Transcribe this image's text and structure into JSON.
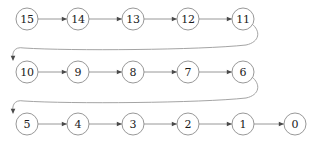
{
  "diagram": {
    "type": "node-chain-diagram",
    "colors": {
      "background": "#ffffff",
      "node_stroke": "#8c8c8c",
      "node_fill": "#ffffff",
      "label_text": "#1a1a1a",
      "edge_stroke": "#8c8c8c",
      "curve_stroke": "#9a9a9a",
      "arrow_fill": "#4a4a4a"
    },
    "node_radius": 11,
    "rows": [
      {
        "row_index": 0,
        "y": 19,
        "nodes": [
          {
            "label": "15",
            "x": 27
          },
          {
            "label": "14",
            "x": 78
          },
          {
            "label": "13",
            "x": 133
          },
          {
            "label": "12",
            "x": 188
          },
          {
            "label": "11",
            "x": 243
          }
        ]
      },
      {
        "row_index": 1,
        "y": 72,
        "nodes": [
          {
            "label": "10",
            "x": 27
          },
          {
            "label": "9",
            "x": 78
          },
          {
            "label": "8",
            "x": 133
          },
          {
            "label": "7",
            "x": 188
          },
          {
            "label": "6",
            "x": 243
          }
        ]
      },
      {
        "row_index": 2,
        "y": 124,
        "nodes": [
          {
            "label": "5",
            "x": 27
          },
          {
            "label": "4",
            "x": 78
          },
          {
            "label": "3",
            "x": 133
          },
          {
            "label": "2",
            "x": 188
          },
          {
            "label": "1",
            "x": 243
          },
          {
            "label": "0",
            "x": 295
          }
        ]
      }
    ],
    "straight_edges": [
      {
        "from": "15",
        "to": "14",
        "x1": 38,
        "y1": 19,
        "x2": 67,
        "y2": 19
      },
      {
        "from": "14",
        "to": "13",
        "x1": 89,
        "y1": 19,
        "x2": 122,
        "y2": 19
      },
      {
        "from": "13",
        "to": "12",
        "x1": 144,
        "y1": 19,
        "x2": 177,
        "y2": 19
      },
      {
        "from": "12",
        "to": "11",
        "x1": 199,
        "y1": 19,
        "x2": 232,
        "y2": 19
      },
      {
        "from": "10",
        "to": "9",
        "x1": 38,
        "y1": 72,
        "x2": 67,
        "y2": 72
      },
      {
        "from": "9",
        "to": "8",
        "x1": 89,
        "y1": 72,
        "x2": 122,
        "y2": 72
      },
      {
        "from": "8",
        "to": "7",
        "x1": 144,
        "y1": 72,
        "x2": 177,
        "y2": 72
      },
      {
        "from": "7",
        "to": "6",
        "x1": 199,
        "y1": 72,
        "x2": 232,
        "y2": 72
      },
      {
        "from": "5",
        "to": "4",
        "x1": 38,
        "y1": 124,
        "x2": 67,
        "y2": 124
      },
      {
        "from": "4",
        "to": "3",
        "x1": 89,
        "y1": 124,
        "x2": 122,
        "y2": 124
      },
      {
        "from": "3",
        "to": "2",
        "x1": 144,
        "y1": 124,
        "x2": 177,
        "y2": 124
      },
      {
        "from": "2",
        "to": "1",
        "x1": 199,
        "y1": 124,
        "x2": 232,
        "y2": 124
      },
      {
        "from": "1",
        "to": "0",
        "x1": 254,
        "y1": 124,
        "x2": 284,
        "y2": 124
      }
    ],
    "wrap_edges": [
      {
        "from": "11",
        "to": "10",
        "path": "M 252 24 C 261 31 260 42 246 45 C 200 50 70 51 24 48 C 13 46 12 54 13 59",
        "arrow_x": 13,
        "arrow_y": 61,
        "arrow_rotation": 90
      },
      {
        "from": "6",
        "to": "5",
        "path": "M 252 77 C 261 84 260 95 246 98 C 200 103 70 104 24 101 C 13 99 12 107 13 112",
        "arrow_x": 13,
        "arrow_y": 114,
        "arrow_rotation": 90
      }
    ]
  }
}
